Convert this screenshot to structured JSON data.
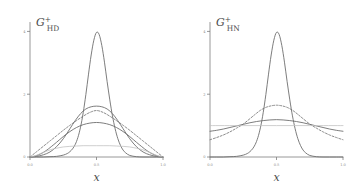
{
  "figure": {
    "panel_count": 2,
    "background": "#ffffff",
    "curve_color": "#6e6e6e",
    "faint_color": "#c2c2c2",
    "axis_color": "#7d7d7d"
  },
  "chart_data": [
    {
      "type": "line",
      "panel": "left",
      "title": "G+HD",
      "ylabel_base": "G",
      "ylabel_sup": "+",
      "ylabel_sub": "HD",
      "xlabel": "x",
      "xlim": [
        0.0,
        1.0
      ],
      "ylim": [
        0.0,
        4.3
      ],
      "xticks": [
        0.0,
        0.5,
        1.0
      ],
      "xticklabels": [
        "0.0",
        "0.5",
        "1.0"
      ],
      "yticks": [
        0,
        2,
        4
      ],
      "yticklabels": [
        "0",
        "2",
        "4"
      ],
      "grid": false,
      "legend": "none",
      "series": [
        {
          "name": "narrow-peak",
          "style": "solid",
          "color": "#6e6e6e",
          "width": 0.9,
          "x": [
            0.0,
            0.05,
            0.1,
            0.15,
            0.2,
            0.25,
            0.28,
            0.3,
            0.32,
            0.34,
            0.36,
            0.38,
            0.4,
            0.42,
            0.44,
            0.46,
            0.48,
            0.5,
            0.52,
            0.54,
            0.56,
            0.58,
            0.6,
            0.62,
            0.64,
            0.66,
            0.68,
            0.7,
            0.72,
            0.75,
            0.8,
            0.85,
            0.9,
            0.95,
            1.0
          ],
          "y": [
            0.0,
            0.0,
            0.0,
            0.01,
            0.02,
            0.06,
            0.11,
            0.17,
            0.26,
            0.4,
            0.62,
            0.95,
            1.41,
            1.99,
            2.64,
            3.25,
            3.72,
            3.97,
            3.9,
            3.55,
            3.02,
            2.4,
            1.82,
            1.31,
            0.9,
            0.59,
            0.37,
            0.22,
            0.13,
            0.05,
            0.01,
            0.0,
            0.0,
            0.0,
            0.0
          ]
        },
        {
          "name": "medium-peak",
          "style": "solid",
          "color": "#6e6e6e",
          "width": 0.9,
          "x": [
            0.0,
            0.05,
            0.1,
            0.15,
            0.2,
            0.25,
            0.3,
            0.34,
            0.38,
            0.42,
            0.46,
            0.5,
            0.54,
            0.58,
            0.62,
            0.66,
            0.7,
            0.75,
            0.8,
            0.85,
            0.9,
            0.95,
            1.0
          ],
          "y": [
            0.0,
            0.02,
            0.07,
            0.16,
            0.33,
            0.58,
            0.9,
            1.16,
            1.38,
            1.53,
            1.6,
            1.62,
            1.6,
            1.53,
            1.38,
            1.16,
            0.9,
            0.58,
            0.33,
            0.16,
            0.07,
            0.02,
            0.0
          ]
        },
        {
          "name": "broad-low",
          "style": "solid",
          "color": "#6e6e6e",
          "width": 0.9,
          "x": [
            0.0,
            0.04,
            0.08,
            0.12,
            0.16,
            0.2,
            0.25,
            0.3,
            0.35,
            0.4,
            0.45,
            0.5,
            0.55,
            0.6,
            0.65,
            0.7,
            0.75,
            0.8,
            0.84,
            0.88,
            0.92,
            0.96,
            1.0
          ],
          "y": [
            0.0,
            0.03,
            0.1,
            0.2,
            0.33,
            0.47,
            0.65,
            0.81,
            0.94,
            1.03,
            1.08,
            1.1,
            1.08,
            1.03,
            0.94,
            0.81,
            0.65,
            0.47,
            0.33,
            0.2,
            0.1,
            0.03,
            0.0
          ]
        },
        {
          "name": "tent-dashed",
          "style": "dashed",
          "color": "#6e6e6e",
          "width": 0.8,
          "x": [
            0.0,
            0.05,
            0.1,
            0.15,
            0.2,
            0.25,
            0.3,
            0.35,
            0.4,
            0.45,
            0.5,
            0.55,
            0.6,
            0.65,
            0.7,
            0.75,
            0.8,
            0.85,
            0.9,
            0.95,
            1.0
          ],
          "y": [
            0.0,
            0.17,
            0.34,
            0.51,
            0.68,
            0.85,
            1.01,
            1.16,
            1.3,
            1.42,
            1.48,
            1.42,
            1.3,
            1.16,
            1.01,
            0.85,
            0.68,
            0.51,
            0.34,
            0.17,
            0.0
          ]
        },
        {
          "name": "faint-flat-hump",
          "style": "solid",
          "color": "#c2c2c2",
          "width": 0.8,
          "x": [
            0.0,
            0.04,
            0.08,
            0.12,
            0.16,
            0.2,
            0.25,
            0.3,
            0.35,
            0.4,
            0.45,
            0.5,
            0.55,
            0.6,
            0.65,
            0.7,
            0.75,
            0.8,
            0.84,
            0.88,
            0.92,
            0.96,
            1.0
          ],
          "y": [
            0.0,
            0.04,
            0.11,
            0.18,
            0.24,
            0.28,
            0.32,
            0.34,
            0.35,
            0.36,
            0.36,
            0.36,
            0.36,
            0.36,
            0.35,
            0.34,
            0.32,
            0.28,
            0.24,
            0.18,
            0.11,
            0.04,
            0.0
          ]
        }
      ]
    },
    {
      "type": "line",
      "panel": "right",
      "title": "G+HN",
      "ylabel_base": "G",
      "ylabel_sup": "+",
      "ylabel_sub": "HN",
      "xlabel": "x",
      "xlim": [
        0.0,
        1.0
      ],
      "ylim": [
        0.0,
        4.3
      ],
      "xticks": [
        0.0,
        0.5,
        1.0
      ],
      "xticklabels": [
        "0.0",
        "0.5",
        "1.0"
      ],
      "yticks": [
        0,
        2,
        4
      ],
      "yticklabels": [
        "0",
        "2",
        "4"
      ],
      "grid": false,
      "legend": "none",
      "series": [
        {
          "name": "narrow-peak",
          "style": "solid",
          "color": "#6e6e6e",
          "width": 0.9,
          "x": [
            0.0,
            0.05,
            0.1,
            0.15,
            0.2,
            0.25,
            0.28,
            0.3,
            0.32,
            0.34,
            0.36,
            0.38,
            0.4,
            0.42,
            0.44,
            0.46,
            0.48,
            0.5,
            0.52,
            0.54,
            0.56,
            0.58,
            0.6,
            0.62,
            0.64,
            0.66,
            0.68,
            0.7,
            0.72,
            0.75,
            0.8,
            0.85,
            0.9,
            0.95,
            1.0
          ],
          "y": [
            0.0,
            0.0,
            0.0,
            0.01,
            0.02,
            0.06,
            0.11,
            0.17,
            0.26,
            0.4,
            0.62,
            0.95,
            1.41,
            1.99,
            2.64,
            3.25,
            3.72,
            3.97,
            3.9,
            3.55,
            3.02,
            2.4,
            1.82,
            1.31,
            0.9,
            0.59,
            0.37,
            0.22,
            0.13,
            0.05,
            0.01,
            0.0,
            0.0,
            0.0,
            0.0
          ]
        },
        {
          "name": "medium-peak",
          "style": "dashed",
          "color": "#6e6e6e",
          "width": 0.8,
          "x": [
            0.0,
            0.05,
            0.1,
            0.15,
            0.2,
            0.25,
            0.3,
            0.34,
            0.38,
            0.42,
            0.46,
            0.5,
            0.54,
            0.58,
            0.62,
            0.66,
            0.7,
            0.75,
            0.8,
            0.85,
            0.9,
            0.95,
            1.0
          ],
          "y": [
            0.55,
            0.62,
            0.7,
            0.8,
            0.92,
            1.05,
            1.22,
            1.36,
            1.49,
            1.58,
            1.63,
            1.65,
            1.63,
            1.58,
            1.49,
            1.36,
            1.22,
            1.05,
            0.92,
            0.8,
            0.7,
            0.62,
            0.55
          ]
        },
        {
          "name": "broad-low",
          "style": "solid",
          "color": "#6e6e6e",
          "width": 0.9,
          "x": [
            0.0,
            0.05,
            0.1,
            0.15,
            0.2,
            0.25,
            0.3,
            0.35,
            0.4,
            0.45,
            0.5,
            0.55,
            0.6,
            0.65,
            0.7,
            0.75,
            0.8,
            0.85,
            0.9,
            0.95,
            1.0
          ],
          "y": [
            0.82,
            0.85,
            0.89,
            0.94,
            0.99,
            1.04,
            1.09,
            1.13,
            1.16,
            1.18,
            1.19,
            1.18,
            1.16,
            1.13,
            1.09,
            1.04,
            0.99,
            0.94,
            0.89,
            0.85,
            0.82
          ]
        },
        {
          "name": "flat-line",
          "style": "solid",
          "color": "#c2c2c2",
          "width": 0.8,
          "x": [
            0.0,
            0.25,
            0.5,
            0.75,
            1.0
          ],
          "y": [
            1.0,
            1.0,
            1.0,
            1.0,
            1.0
          ]
        }
      ]
    }
  ]
}
